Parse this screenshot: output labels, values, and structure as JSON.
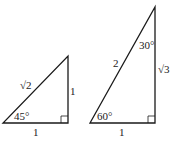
{
  "triangles": [
    {
      "name": "45-45-90",
      "hypotenuse": "√2",
      "vertical_leg": "1",
      "base": "1",
      "angle": "45°"
    },
    {
      "name": "30-60-90",
      "hypotenuse": "2",
      "vertical_leg": "√3",
      "base": "1",
      "bottom_angle": "60°",
      "top_angle": "30°"
    }
  ],
  "colors": {
    "stroke": "#1a1a1a",
    "background": "#ffffff"
  }
}
